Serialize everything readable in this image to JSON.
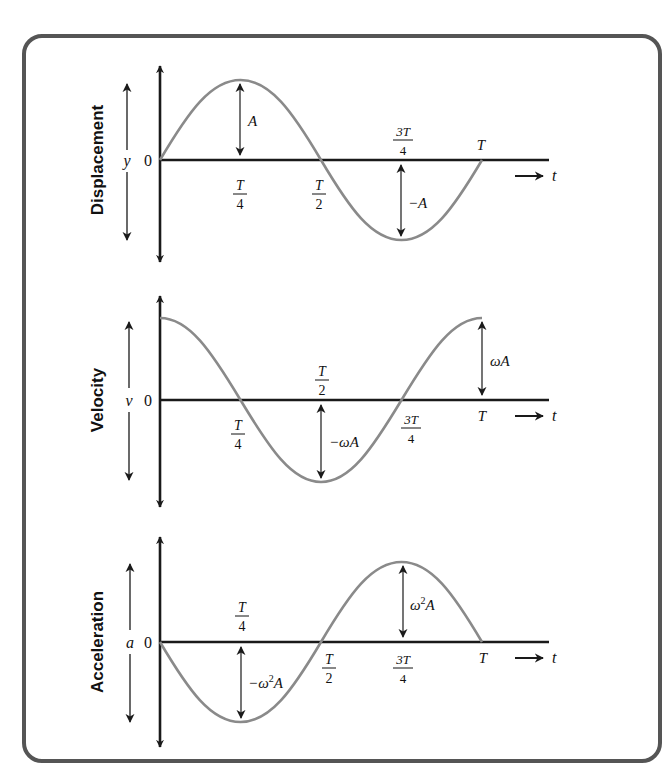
{
  "colors": {
    "frame": "#555555",
    "axis": "#1a1a1a",
    "curve": "#8a8a8a",
    "text": "#111111"
  },
  "geometry": {
    "origin_x": 160,
    "quarter_px": 80.5,
    "amplitude_px": 80
  },
  "panels": [
    {
      "id": "displacement",
      "title": "Displacement",
      "symbol": "y",
      "zero": "0",
      "function": "A*sin(wt)",
      "tick_labels": [
        {
          "pos": "T/4",
          "num": "T",
          "den": "4",
          "side": "below"
        },
        {
          "pos": "T/2",
          "num": "T",
          "den": "2",
          "side": "below"
        },
        {
          "pos": "3T/4",
          "num": "3T",
          "den": "4",
          "side": "above"
        },
        {
          "pos": "T",
          "text": "T",
          "side": "above"
        }
      ],
      "amplitude_markers": [
        {
          "at": "T/4",
          "label": "A"
        },
        {
          "at": "3T/4",
          "label": "−A"
        }
      ],
      "time_label": "t"
    },
    {
      "id": "velocity",
      "title": "Velocity",
      "symbol": "v",
      "zero": "0",
      "function": "wA*cos(wt)",
      "tick_labels": [
        {
          "pos": "T/4",
          "num": "T",
          "den": "4",
          "side": "below"
        },
        {
          "pos": "T/2",
          "num": "T",
          "den": "2",
          "side": "above"
        },
        {
          "pos": "3T/4",
          "num": "3T",
          "den": "4",
          "side": "below"
        },
        {
          "pos": "T",
          "text": "T",
          "side": "below"
        }
      ],
      "amplitude_markers": [
        {
          "at": "T/2",
          "label": "−ωA"
        },
        {
          "at": "T",
          "label": "ωA"
        }
      ],
      "time_label": "t"
    },
    {
      "id": "acceleration",
      "title": "Acceleration",
      "symbol": "a",
      "zero": "0",
      "function": "-w^2A*sin(wt)",
      "tick_labels": [
        {
          "pos": "T/4",
          "num": "T",
          "den": "4",
          "side": "above"
        },
        {
          "pos": "T/2",
          "num": "T",
          "den": "2",
          "side": "below"
        },
        {
          "pos": "3T/4",
          "num": "3T",
          "den": "4",
          "side": "below"
        },
        {
          "pos": "T",
          "text": "T",
          "side": "below"
        }
      ],
      "amplitude_markers": [
        {
          "at": "T/4",
          "label": "−ω²A"
        },
        {
          "at": "3T/4",
          "label": "ω²A"
        }
      ],
      "time_label": "t"
    }
  ],
  "labels": {
    "A": "A",
    "negA": "−A",
    "wA": "ωA",
    "negwA": "−ωA",
    "w2A_base": "ω",
    "w2A_sup": "2",
    "w2A_tail": "A",
    "neg": "−",
    "T": "T",
    "threeT": "3T",
    "four": "4",
    "two": "2",
    "t": "t",
    "zero": "0",
    "y": "y",
    "v": "v",
    "a": "a"
  }
}
